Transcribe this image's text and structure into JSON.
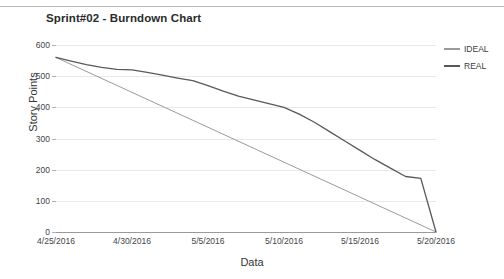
{
  "chart_data": {
    "type": "line",
    "title": "Sprint#02 - Burndown Chart",
    "xlabel": "Data",
    "ylabel": "Story Points",
    "grid": true,
    "legend_position": "right",
    "xlim": [
      "4/25/2016",
      "5/20/2016"
    ],
    "ylim": [
      0,
      600
    ],
    "y_ticks": [
      600,
      500,
      400,
      300,
      200,
      100,
      0
    ],
    "x_ticks": [
      "4/25/2016",
      "4/30/2016",
      "5/5/2016",
      "5/10/2016",
      "5/15/2016",
      "5/20/2016"
    ],
    "x_days": [
      0,
      5,
      10,
      15,
      20,
      25
    ],
    "series": [
      {
        "name": "IDEAL",
        "color": "#9b9b9f",
        "x_days": [
          0,
          25
        ],
        "values": [
          560,
          0
        ]
      },
      {
        "name": "REAL",
        "color": "#585860",
        "x_days": [
          0,
          1,
          2,
          3,
          4,
          5,
          6,
          7,
          8,
          9,
          10,
          11,
          12,
          13,
          14,
          15,
          16,
          17,
          18,
          19,
          20,
          21,
          22,
          23,
          24,
          25
        ],
        "values": [
          560,
          548,
          537,
          528,
          522,
          520,
          512,
          503,
          494,
          486,
          470,
          452,
          436,
          424,
          412,
          400,
          378,
          352,
          322,
          292,
          262,
          232,
          205,
          178,
          172,
          0
        ]
      }
    ]
  },
  "legend": {
    "items": [
      {
        "label": "IDEAL",
        "color": "#9b9b9f"
      },
      {
        "label": "REAL",
        "color": "#585860"
      }
    ]
  }
}
